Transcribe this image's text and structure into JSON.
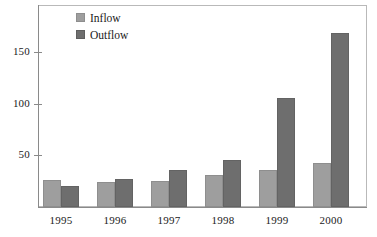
{
  "chart_data": {
    "type": "bar",
    "title": "",
    "subtitle": "",
    "xlabel": "",
    "ylabel": "",
    "categories": [
      "1995",
      "1996",
      "1997",
      "1998",
      "1999",
      "2000"
    ],
    "series": [
      {
        "name": "Inflow",
        "color": "#9e9e9e",
        "values": [
          26,
          24,
          25,
          31,
          36,
          43
        ]
      },
      {
        "name": "Outflow",
        "color": "#6e6e6e",
        "values": [
          20,
          27,
          36,
          46,
          106,
          169
        ]
      }
    ],
    "ylim": [
      0,
      195
    ],
    "yticks": [
      50,
      100,
      150
    ],
    "ytick_labels": [
      "50",
      "100",
      "150"
    ],
    "grid": false,
    "legend_position": "top-left",
    "annotations": []
  },
  "legend": {
    "items": [
      {
        "label": "Inflow",
        "swatch": "inflow-swatch"
      },
      {
        "label": "Outflow",
        "swatch": "outflow-swatch"
      }
    ]
  },
  "colors": {
    "inflow": "#9e9e9e",
    "outflow": "#6e6e6e",
    "axis": "#8a8a8a",
    "frame": "#b9b9b9",
    "text": "#1a1a1a",
    "background": "#ffffff"
  }
}
